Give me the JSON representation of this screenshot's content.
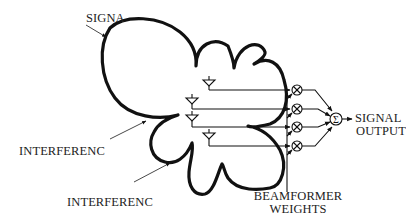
{
  "labels": {
    "signal": "SIGNA",
    "interference_1": "INTERFERENC",
    "interference_2": "INTERFERENC",
    "signal_output_line1": "SIGNAL",
    "signal_output_line2": "OUTPUT",
    "beamformer_line1": "BEAMFORMER",
    "beamformer_line2": "WEIGHTS"
  },
  "symbols": {
    "multiplier": "⊗",
    "summer": "Σ"
  },
  "elements": {
    "antenna_count": 4,
    "multiplier_count": 4,
    "summer_count": 1
  },
  "colors": {
    "stroke": "#111111",
    "background": "#ffffff"
  }
}
